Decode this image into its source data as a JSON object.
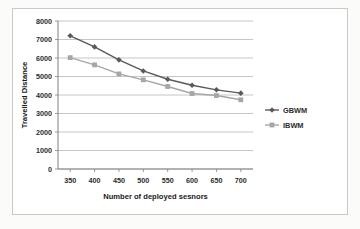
{
  "chart_data": {
    "type": "line",
    "title": "",
    "xlabel": "Number of deployed sesnors",
    "ylabel": "Travelled Distance",
    "x": [
      350,
      400,
      450,
      500,
      550,
      600,
      650,
      700
    ],
    "xticklabels": [
      "350",
      "400",
      "450",
      "500",
      "550",
      "600",
      "650",
      "700"
    ],
    "yticklabels": [
      "0",
      "1000",
      "2000",
      "3000",
      "4000",
      "5000",
      "6000",
      "7000",
      "8000"
    ],
    "yticks": [
      0,
      1000,
      2000,
      3000,
      4000,
      5000,
      6000,
      7000,
      8000
    ],
    "xlim": [
      325,
      725
    ],
    "ylim": [
      0,
      8000
    ],
    "grid": "horizontal",
    "legend_position": "right",
    "series": [
      {
        "name": "GBWM",
        "color": "#595959",
        "marker": "diamond",
        "values": [
          7200,
          6600,
          5900,
          5300,
          4850,
          4530,
          4280,
          4100
        ]
      },
      {
        "name": "IBWM",
        "color": "#a6a6a6",
        "marker": "square",
        "values": [
          6020,
          5630,
          5140,
          4820,
          4460,
          4080,
          3970,
          3740
        ]
      }
    ]
  },
  "legend": {
    "items": [
      {
        "label": "GBWM"
      },
      {
        "label": "IBWM"
      }
    ]
  },
  "colors": {
    "series_dark": "#595959",
    "series_light": "#a6a6a6",
    "gridline": "#b8b8b8",
    "axis": "#808080",
    "border": "#c9c9c9",
    "plot_background": "#ffffff"
  }
}
